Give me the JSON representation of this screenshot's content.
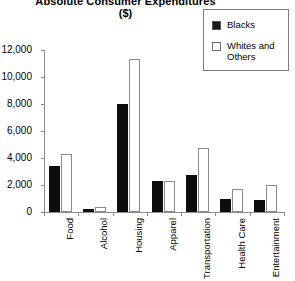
{
  "title": {
    "line1": "Absolute Consumer Expenditures",
    "line2": "($)"
  },
  "legend": {
    "position": "top-right",
    "items": [
      {
        "label": "Blacks",
        "color": "#0d0d0d",
        "swatch": "filled-square-icon"
      },
      {
        "label": "Whites and Others",
        "color": "#ffffff",
        "swatch": "empty-square-icon"
      }
    ]
  },
  "chart_data": {
    "type": "bar",
    "title": "Absolute Consumer Expenditures ($)",
    "xlabel": "",
    "ylabel": "",
    "ylim": [
      0,
      12000
    ],
    "ytick_values": [
      0,
      2000,
      4000,
      6000,
      8000,
      10000,
      12000
    ],
    "ytick_labels": [
      "0",
      "2,000",
      "4,000",
      "6,000",
      "8,000",
      "10,000",
      "12,000"
    ],
    "grid": false,
    "legend_position": "top-right",
    "categories": [
      "Food",
      "Alcohol",
      "Housing",
      "Apparel",
      "Transportation",
      "Health Care",
      "Entertainment"
    ],
    "series": [
      {
        "name": "Blacks",
        "color": "#0d0d0d",
        "values": [
          3400,
          200,
          8000,
          2300,
          2750,
          1000,
          900
        ]
      },
      {
        "name": "Whites and Others",
        "color": "#ffffff",
        "values": [
          4300,
          400,
          11300,
          2300,
          4750,
          1700,
          2000
        ]
      }
    ]
  }
}
